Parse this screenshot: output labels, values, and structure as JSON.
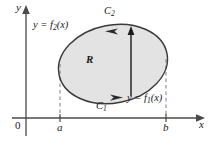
{
  "figure": {
    "colors": {
      "region_fill": "#e3e3e3",
      "curve_stroke": "#3a3a3a",
      "axis_stroke": "#4a4a4a",
      "dashed_stroke": "#8a8a8a",
      "text": "#1a1a1a"
    },
    "axes": {
      "y_label": "y",
      "x_label": "x",
      "origin_label": "0"
    },
    "ticks": [
      {
        "name": "a",
        "label": "a",
        "x": 60
      },
      {
        "name": "b",
        "label": "b",
        "x": 166
      }
    ],
    "labels": {
      "upper_curve": {
        "prefix": "y = f",
        "subscript": "2",
        "suffix": "(x)"
      },
      "lower_curve": {
        "prefix": "y = f",
        "subscript": "1",
        "suffix": "(x)"
      },
      "upper_path": {
        "prefix": "C",
        "subscript": "2"
      },
      "lower_path": {
        "prefix": "C",
        "subscript": "1"
      },
      "region": "R"
    },
    "orientation": "counterclockwise",
    "arrows": {
      "upper_curve_direction": "left",
      "lower_curve_direction": "right",
      "interior_vertical_direction": "up"
    }
  }
}
